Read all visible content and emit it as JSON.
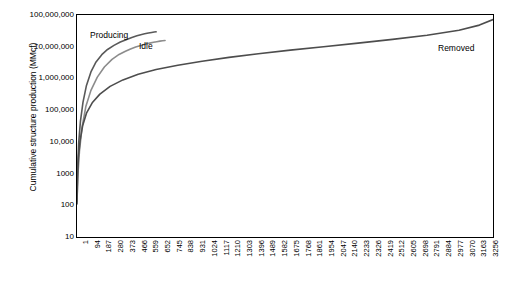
{
  "chart_data": {
    "type": "line",
    "title": "",
    "xlabel": "",
    "ylabel": "Cumulative structure production (MMcf)",
    "ylim": [
      10,
      100000000
    ],
    "ylog": true,
    "grid": false,
    "legend_position": "inline-annotations",
    "ytick_labels": [
      "100,000,000",
      "10,000,000",
      "1,000,000",
      "100,000",
      "10,000",
      "1000",
      "100",
      "10"
    ],
    "ytick_values": [
      100000000,
      10000000,
      1000000,
      100000,
      10000,
      1000,
      100,
      10
    ],
    "xtick_labels": [
      "1",
      "94",
      "187",
      "280",
      "373",
      "466",
      "559",
      "652",
      "745",
      "838",
      "931",
      "1024",
      "1117",
      "1210",
      "1303",
      "1396",
      "1489",
      "1582",
      "1675",
      "1768",
      "1861",
      "1954",
      "2047",
      "2140",
      "2233",
      "2326",
      "2419",
      "2512",
      "2605",
      "2698",
      "2791",
      "2884",
      "2977",
      "3070",
      "3163",
      "3256"
    ],
    "annotations": [
      {
        "text": "Producing",
        "series": "producing"
      },
      {
        "text": "Idle",
        "series": "idle"
      },
      {
        "text": "Removed",
        "series": "removed"
      }
    ],
    "series": [
      {
        "name": "Producing",
        "color": "#595959",
        "x": [
          1,
          6,
          14,
          28,
          48,
          75,
          110,
          150,
          195,
          240,
          290,
          340,
          390,
          430,
          470,
          500,
          530,
          560,
          585,
          605,
          620
        ],
        "y": [
          200,
          1500,
          9000,
          45000,
          180000,
          600000,
          1600000,
          3300000,
          5600000,
          8200000,
          11000000,
          14000000,
          17000000,
          19500000,
          22000000,
          24000000,
          25500000,
          27000000,
          28200000,
          29000000,
          29500000
        ]
      },
      {
        "name": "Idle",
        "color": "#8c8c8c",
        "x": [
          1,
          8,
          20,
          40,
          70,
          110,
          160,
          215,
          275,
          330,
          380,
          420,
          460,
          500,
          540,
          570,
          600,
          625,
          650,
          670,
          690
        ],
        "y": [
          130,
          900,
          5000,
          28000,
          130000,
          420000,
          1100000,
          2300000,
          4000000,
          5700000,
          7200000,
          8500000,
          9800000,
          11000000,
          12200000,
          13000000,
          13800000,
          14400000,
          15000000,
          15400000,
          15700000
        ]
      },
      {
        "name": "Removed",
        "color": "#4d4d4d",
        "x": [
          1,
          5,
          12,
          25,
          45,
          75,
          120,
          180,
          260,
          360,
          480,
          620,
          790,
          980,
          1190,
          1420,
          1670,
          1930,
          2200,
          2470,
          2740,
          2990,
          3150,
          3256
        ],
        "y": [
          110,
          700,
          3200,
          11000,
          32000,
          80000,
          170000,
          320000,
          560000,
          900000,
          1350000,
          1900000,
          2600000,
          3500000,
          4600000,
          6000000,
          7800000,
          10000000,
          13000000,
          17000000,
          23000000,
          33000000,
          48000000,
          72000000
        ]
      }
    ]
  }
}
